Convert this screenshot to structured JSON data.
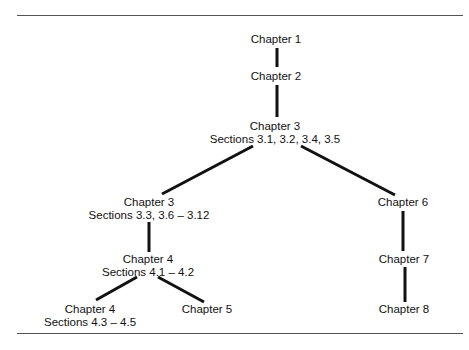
{
  "diagram": {
    "type": "tree",
    "title": "",
    "nodes": [
      {
        "id": "n1",
        "title": "Chapter 1",
        "subtitle": ""
      },
      {
        "id": "n2",
        "title": "Chapter 2",
        "subtitle": ""
      },
      {
        "id": "n3",
        "title": "Chapter 3",
        "subtitle": "Sections 3.1, 3.2, 3.4, 3.5"
      },
      {
        "id": "n4",
        "title": "Chapter 3",
        "subtitle": "Sections 3.3, 3.6 – 3.12"
      },
      {
        "id": "n5",
        "title": "Chapter 6",
        "subtitle": ""
      },
      {
        "id": "n6",
        "title": "Chapter 4",
        "subtitle": "Sections 4.1 – 4.2"
      },
      {
        "id": "n7",
        "title": "Chapter 7",
        "subtitle": ""
      },
      {
        "id": "n8",
        "title": "Chapter 4",
        "subtitle": "Sections 4.3 – 4.5"
      },
      {
        "id": "n9",
        "title": "Chapter 5",
        "subtitle": ""
      },
      {
        "id": "n10",
        "title": "Chapter 8",
        "subtitle": ""
      }
    ],
    "edges": [
      [
        "n1",
        "n2"
      ],
      [
        "n2",
        "n3"
      ],
      [
        "n3",
        "n4"
      ],
      [
        "n3",
        "n5"
      ],
      [
        "n4",
        "n6"
      ],
      [
        "n6",
        "n8"
      ],
      [
        "n6",
        "n9"
      ],
      [
        "n5",
        "n7"
      ],
      [
        "n7",
        "n10"
      ]
    ]
  }
}
